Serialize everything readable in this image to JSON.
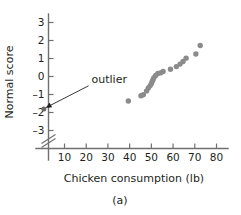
{
  "chart_data": {
    "type": "scatter",
    "title": "",
    "xlabel": "Chicken consumption (lb)",
    "ylabel": "Normal score",
    "caption": "(a)",
    "xlim": [
      0,
      85
    ],
    "ylim": [
      -3.9,
      3.6
    ],
    "xticks": [
      10,
      20,
      30,
      40,
      50,
      60,
      70,
      80
    ],
    "xtick_labels": [
      "10",
      "20",
      "30",
      "40",
      "50",
      "60",
      "70",
      "80"
    ],
    "yticks": [
      3,
      2,
      1,
      0,
      -1,
      -2,
      -3
    ],
    "ytick_labels": [
      "3",
      "2",
      "1",
      "0",
      "-1",
      "-2",
      "-3"
    ],
    "grid": false,
    "legend": "none",
    "y_axis_break": true,
    "marker_color": "#8b8b8b",
    "axis_color": "#6f7072",
    "text_color": "#231f20",
    "annotations": [
      {
        "label": "outlier",
        "target_x": 0.5,
        "target_y": -1.8,
        "text_x": 22,
        "text_y": -0.35
      }
    ],
    "points": [
      {
        "x": 0.5,
        "y": -1.8,
        "outlier": true
      },
      {
        "x": 39.4,
        "y": -1.36,
        "outlier": false
      },
      {
        "x": 45.2,
        "y": -1.07,
        "outlier": false
      },
      {
        "x": 46.3,
        "y": -1.01,
        "outlier": false
      },
      {
        "x": 47.8,
        "y": -0.8,
        "outlier": false
      },
      {
        "x": 48.6,
        "y": -0.64,
        "outlier": false
      },
      {
        "x": 49.4,
        "y": -0.52,
        "outlier": false
      },
      {
        "x": 50.0,
        "y": -0.4,
        "outlier": false
      },
      {
        "x": 50.4,
        "y": -0.28,
        "outlier": false
      },
      {
        "x": 50.8,
        "y": -0.17,
        "outlier": false
      },
      {
        "x": 51.2,
        "y": -0.06,
        "outlier": false
      },
      {
        "x": 52.0,
        "y": 0.06,
        "outlier": false
      },
      {
        "x": 53.0,
        "y": 0.17,
        "outlier": false
      },
      {
        "x": 54.2,
        "y": 0.2,
        "outlier": false
      },
      {
        "x": 55.4,
        "y": 0.28,
        "outlier": false
      },
      {
        "x": 58.8,
        "y": 0.4,
        "outlier": false
      },
      {
        "x": 61.5,
        "y": 0.55,
        "outlier": false
      },
      {
        "x": 63.2,
        "y": 0.69,
        "outlier": false
      },
      {
        "x": 64.6,
        "y": 0.83,
        "outlier": false
      },
      {
        "x": 66.0,
        "y": 1.02,
        "outlier": false
      },
      {
        "x": 70.5,
        "y": 1.25,
        "outlier": false
      },
      {
        "x": 72.5,
        "y": 1.72,
        "outlier": false
      }
    ]
  }
}
